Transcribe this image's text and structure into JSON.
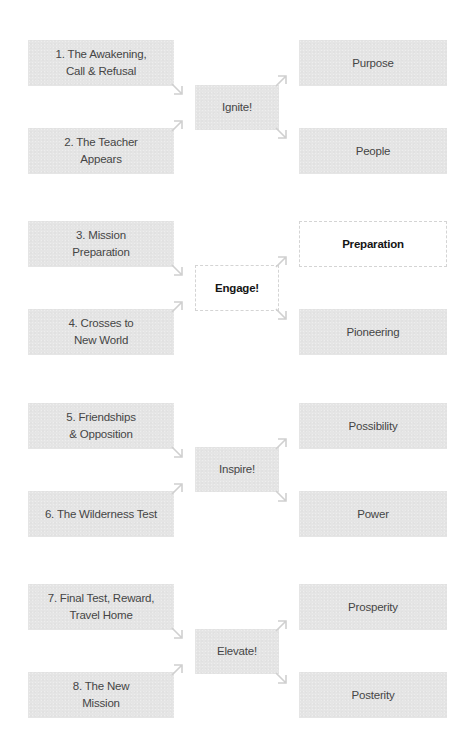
{
  "diagram": {
    "colors": {
      "box_fill": "#e5e5e5",
      "box_text": "#454545",
      "highlight_fill": "#ffffff",
      "highlight_border": "#d4d4d4",
      "highlight_text": "#151515",
      "arrow": "#d0d0d0"
    },
    "groups": [
      {
        "inputs": [
          "1.  The Awakening,\nCall & Refusal",
          "2.  The Teacher\nAppears"
        ],
        "center": "Ignite!",
        "outputs": [
          "Purpose",
          "People"
        ],
        "highlighted": false
      },
      {
        "inputs": [
          "3.  Mission\nPreparation",
          "4.  Crosses to\nNew World"
        ],
        "center": "Engage!",
        "outputs": [
          "Preparation",
          "Pioneering"
        ],
        "highlighted": true
      },
      {
        "inputs": [
          "5.  Friendships\n& Opposition",
          "6.  The Wilderness Test"
        ],
        "center": "Inspire!",
        "outputs": [
          "Possibility",
          "Power"
        ],
        "highlighted": false
      },
      {
        "inputs": [
          "7.  Final Test, Reward,\nTravel Home",
          "8.  The New\nMission"
        ],
        "center": "Elevate!",
        "outputs": [
          "Prosperity",
          "Posterity"
        ],
        "highlighted": false
      }
    ]
  }
}
